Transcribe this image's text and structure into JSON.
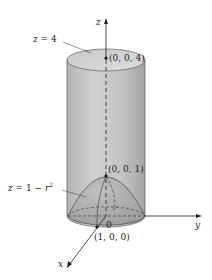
{
  "diagram": {
    "type": "3d-solid-region",
    "labels": {
      "top_plane": "z = 4",
      "paraboloid": "z = 1 − r",
      "paraboloid_exp": "2",
      "axis_z": "z",
      "axis_y": "y",
      "axis_x": "x",
      "origin": "0",
      "point_top": "(0, 0, 4)",
      "point_vertex": "(0, 0, 1)",
      "point_x": "(1, 0, 0)"
    },
    "colors": {
      "cylinder_fill": "#c8c8c8",
      "cylinder_shadow": "#a8a8a8",
      "top_fill": "#d4d4d4",
      "paraboloid_fill": "#b0b0b0",
      "line": "#333333"
    }
  }
}
